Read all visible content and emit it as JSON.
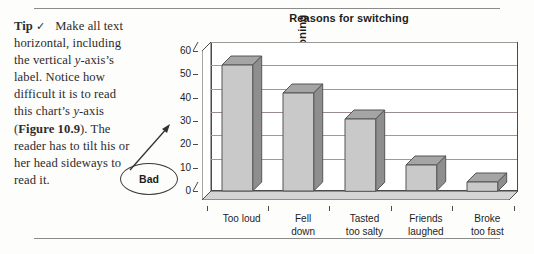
{
  "page": {
    "background": "#fdfdfc",
    "rule_color": "#8b8b8b"
  },
  "tip": {
    "label": "Tip",
    "check_icon": "✓",
    "body_parts": [
      {
        "text": "Make all text horizontal, including the vertical ",
        "style": "normal"
      },
      {
        "text": "y",
        "style": "italic"
      },
      {
        "text": "-axis’s label. Notice how difficult it is to read this chart’s ",
        "style": "normal"
      },
      {
        "text": "y",
        "style": "italic"
      },
      {
        "text": "-axis (",
        "style": "normal"
      },
      {
        "text": "Figure 10.9",
        "style": "bold"
      },
      {
        "text": "). The reader has to tilt his or her head sideways to read it.",
        "style": "normal"
      }
    ],
    "full_text": "Make all text horizontal, including the vertical y-axis’s label. Notice how difficult it is to read this chart’s y-axis (Figure 10.9). The reader has to tilt his or her head sideways to read it."
  },
  "annotation": {
    "oval_label": "Bad",
    "arrow": "arrow-to-y-axis-title"
  },
  "chart_data": {
    "type": "bar",
    "title": "Reasons for switching",
    "xlabel": "",
    "ylabel": "% mentioning",
    "ylabel_rotated": true,
    "categories": [
      "Too loud",
      "Fell down",
      "Tasted too salty",
      "Friends laughed",
      "Broke too fast"
    ],
    "category_lines": [
      [
        "Too loud"
      ],
      [
        "Fell",
        "down"
      ],
      [
        "Tasted",
        "too salty"
      ],
      [
        "Friends",
        "laughed"
      ],
      [
        "Broke",
        "too fast"
      ]
    ],
    "values": [
      54,
      42,
      31,
      11,
      4
    ],
    "ylim": [
      0,
      60
    ],
    "yticks": [
      0,
      10,
      20,
      30,
      40,
      50,
      60
    ],
    "ytick_labels": [
      "0",
      "10",
      "20",
      "30",
      "40",
      "50",
      "60"
    ],
    "grid": true,
    "legend": null,
    "legend_position": "none",
    "style": "3d-column",
    "colors": {
      "bar_front": "#c9c9c9",
      "bar_side": "#8e8e8e",
      "bar_top": "#a5a5a5",
      "axis": "#4a4a4a",
      "gridline": "#9a9a9a",
      "text": "#1d1d1d"
    }
  }
}
